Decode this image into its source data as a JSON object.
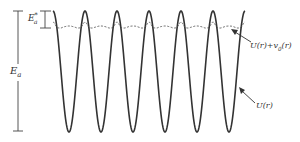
{
  "figure": {
    "labels": {
      "activation_energy": "E",
      "activation_energy_sub": "a",
      "activation_energy_star": "E",
      "activation_energy_star_sup": "*",
      "activation_energy_star_sub": "a",
      "perturbed_potential": "U(r)+v",
      "perturbed_potential_sub": "0",
      "perturbed_potential_tail": "(r)",
      "potential": "U(r)"
    },
    "colors": {
      "curve": "#333333",
      "dashed": "#555555",
      "bracket": "#444444"
    },
    "curve": {
      "x_start": 53,
      "period": 32,
      "cycles": 6,
      "y_top": 11,
      "y_bottom": 132
    },
    "dashed_curve": {
      "y_level": 28,
      "y_bump": 22
    }
  }
}
